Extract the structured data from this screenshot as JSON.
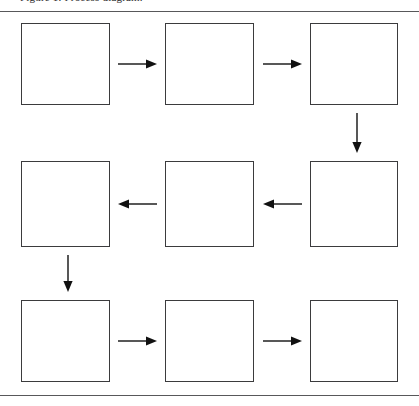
{
  "figure": {
    "type": "flowchart",
    "layout": "serpentine-grid-3x3",
    "clipped_caption": "Figure 1. Process diagram.",
    "background_color": "#ffffff",
    "line_color": "#3b3b3d",
    "arrow_color": "#111111",
    "rule_color": "#58585a",
    "canvas": {
      "width": 419,
      "height": 406
    }
  },
  "rules": [
    {
      "name": "top-rule",
      "y": 11
    },
    {
      "name": "bottom-rule",
      "y": 395
    }
  ],
  "boxes": [
    {
      "id": "box-1",
      "label": "",
      "row": 1,
      "col": 1,
      "x": 21,
      "y": 23,
      "w": 89,
      "h": 82
    },
    {
      "id": "box-2",
      "label": "",
      "row": 1,
      "col": 2,
      "x": 165,
      "y": 23,
      "w": 89,
      "h": 82
    },
    {
      "id": "box-3",
      "label": "",
      "row": 1,
      "col": 3,
      "x": 310,
      "y": 23,
      "w": 88,
      "h": 82
    },
    {
      "id": "box-4",
      "label": "",
      "row": 2,
      "col": 1,
      "x": 21,
      "y": 161,
      "w": 89,
      "h": 86
    },
    {
      "id": "box-5",
      "label": "",
      "row": 2,
      "col": 2,
      "x": 165,
      "y": 161,
      "w": 89,
      "h": 86
    },
    {
      "id": "box-6",
      "label": "",
      "row": 2,
      "col": 3,
      "x": 310,
      "y": 161,
      "w": 88,
      "h": 86
    },
    {
      "id": "box-7",
      "label": "",
      "row": 3,
      "col": 1,
      "x": 21,
      "y": 300,
      "w": 89,
      "h": 82
    },
    {
      "id": "box-8",
      "label": "",
      "row": 3,
      "col": 2,
      "x": 165,
      "y": 300,
      "w": 89,
      "h": 82
    },
    {
      "id": "box-9",
      "label": "",
      "row": 3,
      "col": 3,
      "x": 310,
      "y": 300,
      "w": 88,
      "h": 82
    }
  ],
  "arrows": [
    {
      "id": "arrow-1-2",
      "from": "box-1",
      "to": "box-2",
      "direction": "right",
      "x1": 118,
      "y1": 64,
      "x2": 157,
      "y2": 64
    },
    {
      "id": "arrow-2-3",
      "from": "box-2",
      "to": "box-3",
      "direction": "right",
      "x1": 263,
      "y1": 64,
      "x2": 302,
      "y2": 64
    },
    {
      "id": "arrow-3-6",
      "from": "box-3",
      "to": "box-6",
      "direction": "down",
      "x1": 357,
      "y1": 113,
      "x2": 357,
      "y2": 153
    },
    {
      "id": "arrow-6-5",
      "from": "box-6",
      "to": "box-5",
      "direction": "left",
      "x1": 302,
      "y1": 204,
      "x2": 263,
      "y2": 204
    },
    {
      "id": "arrow-5-4",
      "from": "box-5",
      "to": "box-4",
      "direction": "left",
      "x1": 157,
      "y1": 204,
      "x2": 118,
      "y2": 204
    },
    {
      "id": "arrow-4-7",
      "from": "box-4",
      "to": "box-7",
      "direction": "down",
      "x1": 68,
      "y1": 255,
      "x2": 68,
      "y2": 292
    },
    {
      "id": "arrow-7-8",
      "from": "box-7",
      "to": "box-8",
      "direction": "right",
      "x1": 118,
      "y1": 341,
      "x2": 157,
      "y2": 341
    },
    {
      "id": "arrow-8-9",
      "from": "box-8",
      "to": "box-9",
      "direction": "right",
      "x1": 263,
      "y1": 341,
      "x2": 302,
      "y2": 341
    }
  ]
}
